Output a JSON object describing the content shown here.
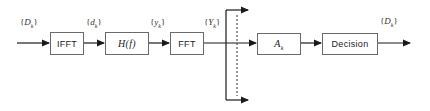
{
  "diagram": {
    "type": "block-diagram",
    "blocks": [
      {
        "id": "ifft",
        "label": "IFFT"
      },
      {
        "id": "channel",
        "label": "H(f)"
      },
      {
        "id": "fft",
        "label": "FFT"
      },
      {
        "id": "equalizer",
        "label": "A",
        "subscript": "k"
      },
      {
        "id": "decision",
        "label": "Decision"
      }
    ],
    "signals": [
      {
        "id": "input",
        "open": "{",
        "symbol": "D",
        "subscript": "k",
        "close": "}"
      },
      {
        "id": "ifft_out",
        "open": "{",
        "symbol": "d",
        "subscript": "k",
        "close": "}"
      },
      {
        "id": "channel_out",
        "open": "{",
        "symbol": "y",
        "subscript": "k",
        "close": "}"
      },
      {
        "id": "fft_out",
        "open": "{",
        "symbol": "Y",
        "subscript": "k",
        "close": "}"
      },
      {
        "id": "output",
        "open": "{",
        "symbol": "D",
        "subscript": "k",
        "close": "}"
      }
    ],
    "edges": [
      {
        "from": "input",
        "to": "ifft"
      },
      {
        "from": "ifft",
        "to": "channel"
      },
      {
        "from": "channel",
        "to": "fft"
      },
      {
        "from": "fft",
        "to": "equalizer"
      },
      {
        "from": "fft",
        "to": "branch-top"
      },
      {
        "from": "fft",
        "to": "branch-bottom"
      },
      {
        "from": "equalizer",
        "to": "decision"
      },
      {
        "from": "decision",
        "to": "output"
      }
    ],
    "colors": {
      "line": "#1a1a1a",
      "box_border": "#6a6a6a",
      "dashed": "#333333"
    }
  }
}
